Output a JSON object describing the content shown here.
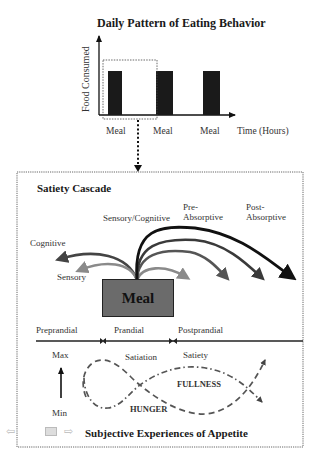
{
  "top_chart": {
    "title": "Daily Pattern of Eating Behavior",
    "ylabel": "Food Consumed",
    "xlabel": "Time (Hours)",
    "bar_labels": [
      "Meal",
      "Meal",
      "Meal"
    ]
  },
  "cascade": {
    "title": "Satiety Cascade",
    "labels": {
      "cognitive": "Cognitive",
      "sensory": "Sensory",
      "sensory_cognitive": "Sensory/Cognitive",
      "pre_absorptive_1": "Pre-",
      "pre_absorptive_2": "Absorptive",
      "post_absorptive_1": "Post-",
      "post_absorptive_2": "Absorptive"
    },
    "meal_label": "Meal",
    "timeline": {
      "preprandial": "Preprandial",
      "prandial": "Prandial",
      "postprandial": "Postprandial"
    }
  },
  "appetite": {
    "title": "Subjective Experiences of Appetite",
    "max": "Max",
    "min": "Min",
    "satiation": "Satiation",
    "satiety": "Satiety",
    "fullness": "FULLNESS",
    "hunger": "HUNGER"
  },
  "colors": {
    "bar": "#1a1a1a",
    "meal_box": "#6b6b6b",
    "arrow_black": "#111111",
    "arrow_dark": "#3a3a3a",
    "arrow_mid": "#555555",
    "arrow_light": "#8a8a8a"
  },
  "nav": {
    "back_icon": "back-arrow-icon",
    "screen_icon": "screen-icon",
    "forward_icon": "forward-arrow-icon"
  }
}
